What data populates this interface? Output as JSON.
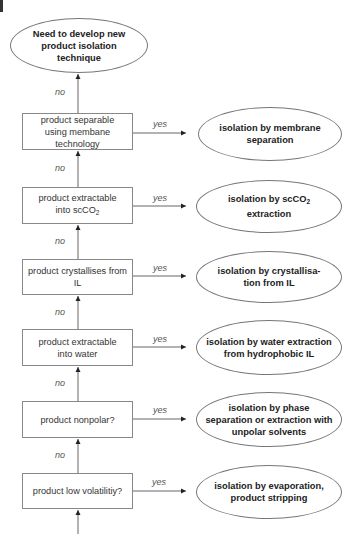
{
  "diagram": {
    "type": "flowchart",
    "top_node": {
      "text": "Need to develop new product isolation technique"
    },
    "decisions": [
      {
        "text": "product separable using membane technology",
        "yes_outcome": "isolation by membrane separation"
      },
      {
        "text_main": "product extractable into scCO",
        "text_sub": "2",
        "yes_outcome_main": "isolation by  scCO",
        "yes_outcome_sub": "2",
        "yes_outcome_tail": " extraction"
      },
      {
        "text": "product crystallises from IL",
        "yes_outcome": "isolation by crystallisa-tion from IL"
      },
      {
        "text": "product extractable into water",
        "yes_outcome": "isolation by  water extraction from hydrophobic IL"
      },
      {
        "text": "product nonpolar?",
        "yes_outcome": "isolation by phase separation or extraction with unpolar solvents"
      },
      {
        "text": "product low volatilitiy?",
        "yes_outcome": "isolation by evaporation, product stripping"
      }
    ],
    "labels": {
      "yes": "yes",
      "no": "no"
    }
  }
}
